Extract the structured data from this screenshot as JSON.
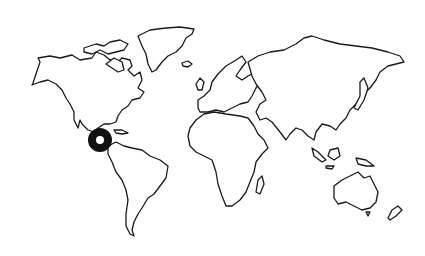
{
  "map": {
    "type": "world-outline",
    "background": "#ffffff",
    "outline_color": "#1a1a1a",
    "regions": [
      "North America",
      "Greenland",
      "South America",
      "Europe",
      "Africa",
      "Asia",
      "Australia",
      "New Zealand",
      "Madagascar",
      "Japan",
      "Indonesia",
      "UK",
      "Iceland"
    ],
    "marker": {
      "icon": "ring-marker-icon",
      "location": "Central America",
      "color": "#111111",
      "cx": 100,
      "cy": 140
    }
  }
}
